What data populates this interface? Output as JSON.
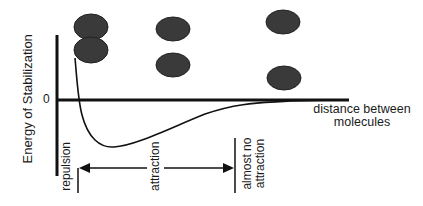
{
  "diagram": {
    "y_axis": {
      "label": "Energy of Stabilization",
      "zero_label": "0"
    },
    "x_axis": {
      "label_line1": "distance between",
      "label_line2": "molecules"
    },
    "regions": {
      "repulsion": "repulsion",
      "attraction": "attraction",
      "almost_no_attraction_line1": "almost no",
      "almost_no_attraction_line2": "attraction"
    },
    "molecule_pairs": [
      {
        "name": "overlapping",
        "x": 91,
        "y_top": 27,
        "y_bottom": 50
      },
      {
        "name": "optimal",
        "x": 173,
        "y_top": 29,
        "y_bottom": 65
      },
      {
        "name": "far-apart",
        "x": 283,
        "y_top": 22,
        "y_bottom": 78
      }
    ],
    "colors": {
      "line": "#111111",
      "molecule": "#3a3a3a"
    }
  }
}
